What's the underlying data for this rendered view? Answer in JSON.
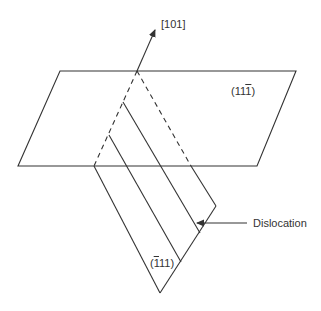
{
  "diagram": {
    "direction_label": "[101]",
    "plane_top": {
      "pre": "(11",
      "bar_digit": "1",
      "post": ")"
    },
    "plane_inclined": {
      "pre": "(",
      "bar_digit": "1",
      "post": "11)"
    },
    "dislocation_label": "Dislocation",
    "line_color": "#333333"
  }
}
